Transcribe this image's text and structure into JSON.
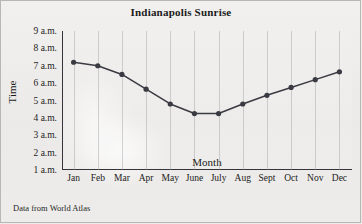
{
  "chart_data": {
    "type": "line",
    "title": "Indianapolis Sunrise",
    "xlabel": "Month",
    "ylabel": "Time",
    "categories": [
      "Jan",
      "Feb",
      "Mar",
      "Apr",
      "May",
      "June",
      "July",
      "Aug",
      "Sept",
      "Oct",
      "Nov",
      "Dec"
    ],
    "values": [
      7.2,
      7.0,
      6.5,
      5.65,
      4.8,
      4.25,
      4.25,
      4.8,
      5.3,
      5.75,
      6.2,
      6.65
    ],
    "ytick_labels": [
      "1 a.m.",
      "2 a.m.",
      "3 a.m.",
      "4 a.m.",
      "5 a.m.",
      "6 a.m.",
      "7 a.m.",
      "8 a.m.",
      "9 a.m."
    ],
    "ytick_values": [
      1,
      2,
      3,
      4,
      5,
      6,
      7,
      8,
      9
    ],
    "ylim": [
      1,
      9
    ],
    "grid": "vertical",
    "legend": "none",
    "series_color": "#3a3a42",
    "marker": "circle"
  },
  "footnote": "Data from World Atlas"
}
